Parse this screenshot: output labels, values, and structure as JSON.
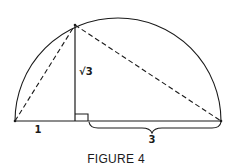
{
  "figure": {
    "caption": "FIGURE 4",
    "labels": {
      "left_segment": "1",
      "altitude": "√3",
      "right_segment": "3"
    },
    "colors": {
      "stroke": "#1a1a1a",
      "background": "#ffffff"
    },
    "elements": [
      "semicircle arc over diameter",
      "diameter baseline",
      "vertical altitude from apex to base",
      "dashed chord from left endpoint to apex",
      "dashed chord from apex to right endpoint",
      "right-angle marker at foot of altitude",
      "curly brace under right segment"
    ]
  }
}
